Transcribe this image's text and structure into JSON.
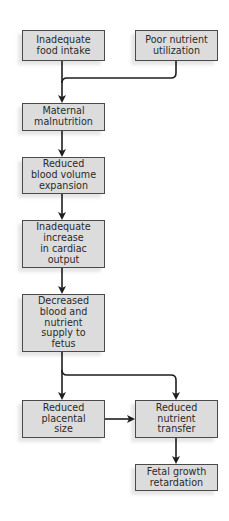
{
  "diagram": {
    "colors": {
      "box_fill": "#dcdcdc",
      "box_border": "#4a4a4a",
      "arrow": "#1e1e1e",
      "text": "#2a2a2a",
      "background": "#ffffff"
    },
    "nodes": [
      {
        "id": "food-intake",
        "label": "Inadequate\nfood intake"
      },
      {
        "id": "nutrient-utilization",
        "label": "Poor nutrient\nutilization"
      },
      {
        "id": "maternal-malnutrition",
        "label": "Maternal\nmalnutrition"
      },
      {
        "id": "blood-volume",
        "label": "Reduced\nblood volume\nexpansion"
      },
      {
        "id": "cardiac-output",
        "label": "Inadequate\nincrease\nin cardiac\noutput"
      },
      {
        "id": "supply-to-fetus",
        "label": "Decreased\nblood and\nnutrient\nsupply to\nfetus"
      },
      {
        "id": "placental-size",
        "label": "Reduced\nplacental\nsize"
      },
      {
        "id": "nutrient-transfer",
        "label": "Reduced\nnutrient\ntransfer"
      },
      {
        "id": "fetal-growth",
        "label": "Fetal growth\nretardation"
      }
    ],
    "edges": [
      {
        "from": "food-intake",
        "to": "maternal-malnutrition"
      },
      {
        "from": "nutrient-utilization",
        "to": "maternal-malnutrition"
      },
      {
        "from": "maternal-malnutrition",
        "to": "blood-volume"
      },
      {
        "from": "blood-volume",
        "to": "cardiac-output"
      },
      {
        "from": "cardiac-output",
        "to": "supply-to-fetus"
      },
      {
        "from": "supply-to-fetus",
        "to": "placental-size"
      },
      {
        "from": "supply-to-fetus",
        "to": "nutrient-transfer"
      },
      {
        "from": "placental-size",
        "to": "nutrient-transfer"
      },
      {
        "from": "nutrient-transfer",
        "to": "fetal-growth"
      }
    ]
  }
}
